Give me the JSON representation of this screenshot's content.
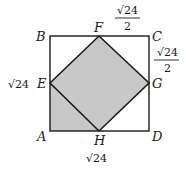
{
  "figure": {
    "points": {
      "A": "A",
      "B": "B",
      "C": "C",
      "D": "D",
      "E": "E",
      "F": "F",
      "G": "G",
      "H": "H"
    },
    "measurements": {
      "left_side": "√24",
      "bottom_side": "√24",
      "top_right_segment": {
        "numerator": "√24",
        "denominator": "2"
      },
      "right_upper_segment": {
        "numerator": "√24",
        "denominator": "2"
      }
    },
    "shading": {
      "shaded_regions": [
        "quadrilateral EFGH",
        "triangle AEH"
      ],
      "fill_color": "#c8c8c8",
      "stroke_color": "#1a1a1a"
    }
  }
}
